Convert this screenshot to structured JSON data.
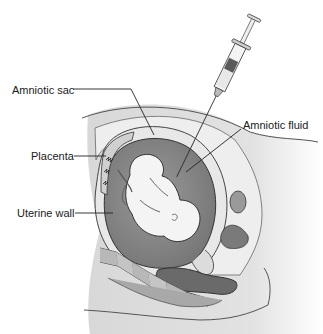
{
  "figure": {
    "labels": [
      {
        "id": "amniotic-sac",
        "text": "Amniotic sac"
      },
      {
        "id": "placenta",
        "text": "Placenta"
      },
      {
        "id": "uterine-wall",
        "text": "Uterine wall"
      },
      {
        "id": "amniotic-fluid",
        "text": "Amniotic fluid"
      }
    ],
    "colors": {
      "background": "#ffffff",
      "skin": "#e4e4e4",
      "tissue_light": "#f0f0f0",
      "fluid": "#8c8c8c",
      "dark_organ": "#6e6e6e",
      "outline": "#3a3a3a",
      "syringe_fill": "#5a5a5a"
    }
  }
}
